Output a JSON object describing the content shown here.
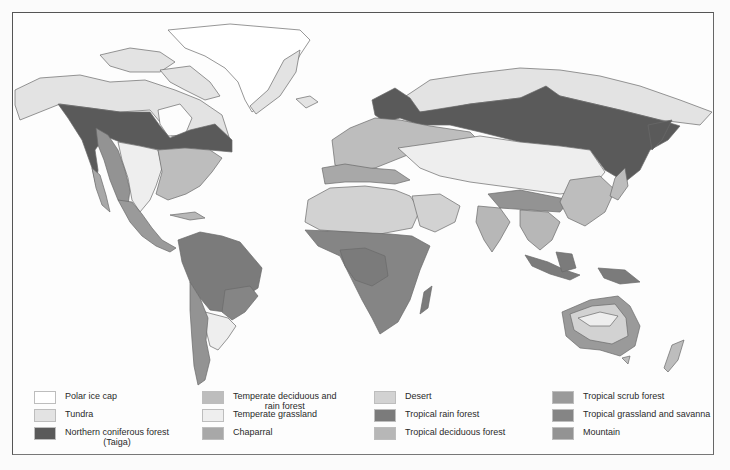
{
  "map": {
    "title": "World biomes",
    "regions": [
      {
        "name": "Greenland",
        "biome": "polar_ice_cap"
      },
      {
        "name": "Arctic Canada",
        "biome": "tundra"
      },
      {
        "name": "Alaska",
        "biome": "tundra"
      },
      {
        "name": "Canada boreal belt",
        "biome": "northern_coniferous_forest"
      },
      {
        "name": "Western North America",
        "biome": "mountain"
      },
      {
        "name": "Great Plains",
        "biome": "temperate_grassland"
      },
      {
        "name": "Eastern United States",
        "biome": "temperate_deciduous_and_rain_forest"
      },
      {
        "name": "Siberia boreal belt",
        "biome": "northern_coniferous_forest"
      },
      {
        "name": "Northern Siberia",
        "biome": "tundra"
      },
      {
        "name": "Europe",
        "biome": "temperate_deciduous_and_rain_forest"
      },
      {
        "name": "Central Asian steppe",
        "biome": "temperate_grassland"
      },
      {
        "name": "Sahara / Arabia",
        "biome": "desert"
      },
      {
        "name": "Central Africa",
        "biome": "tropical_rain_forest"
      },
      {
        "name": "Southern & East Africa",
        "biome": "tropical_grassland_and_savanna"
      },
      {
        "name": "Amazon",
        "biome": "tropical_rain_forest"
      },
      {
        "name": "Patagonia / Andes",
        "biome": "mountain"
      },
      {
        "name": "India & Southeast Asia",
        "biome": "tropical_deciduous_forest"
      },
      {
        "name": "Himalaya / Tibet",
        "biome": "mountain"
      },
      {
        "name": "Indonesia & New Guinea",
        "biome": "tropical_rain_forest"
      },
      {
        "name": "Interior Australia",
        "biome": "desert"
      },
      {
        "name": "Coastal Australia",
        "biome": "tropical_scrub_forest"
      },
      {
        "name": "New Zealand",
        "biome": "temperate_deciduous_and_rain_forest"
      }
    ]
  },
  "legend": {
    "items": [
      {
        "key": "polar_ice_cap",
        "label": "Polar ice cap",
        "sub": "",
        "color": "#ffffff"
      },
      {
        "key": "tundra",
        "label": "Tundra",
        "sub": "",
        "color": "#e3e3e3"
      },
      {
        "key": "northern_coniferous_forest",
        "label": "Northern coniferous forest",
        "sub": "(Taiga)",
        "color": "#5a5a5a"
      },
      {
        "key": "temperate_deciduous_and_rain_forest",
        "label": "Temperate deciduous and",
        "sub": "rain forest",
        "color": "#bdbdbd"
      },
      {
        "key": "temperate_grassland",
        "label": "Temperate grassland",
        "sub": "",
        "color": "#eeeeee"
      },
      {
        "key": "chaparral",
        "label": "Chaparral",
        "sub": "",
        "color": "#a8a8a8"
      },
      {
        "key": "desert",
        "label": "Desert",
        "sub": "",
        "color": "#d2d2d2"
      },
      {
        "key": "tropical_rain_forest",
        "label": "Tropical rain forest",
        "sub": "",
        "color": "#7b7b7b"
      },
      {
        "key": "tropical_deciduous_forest",
        "label": "Tropical deciduous forest",
        "sub": "",
        "color": "#b7b7b7"
      },
      {
        "key": "tropical_scrub_forest",
        "label": "Tropical scrub forest",
        "sub": "",
        "color": "#9a9a9a"
      },
      {
        "key": "tropical_grassland_and_savanna",
        "label": "Tropical grassland and savanna",
        "sub": "",
        "color": "#858585"
      },
      {
        "key": "mountain",
        "label": "Mountain",
        "sub": "",
        "color": "#939393"
      }
    ]
  }
}
